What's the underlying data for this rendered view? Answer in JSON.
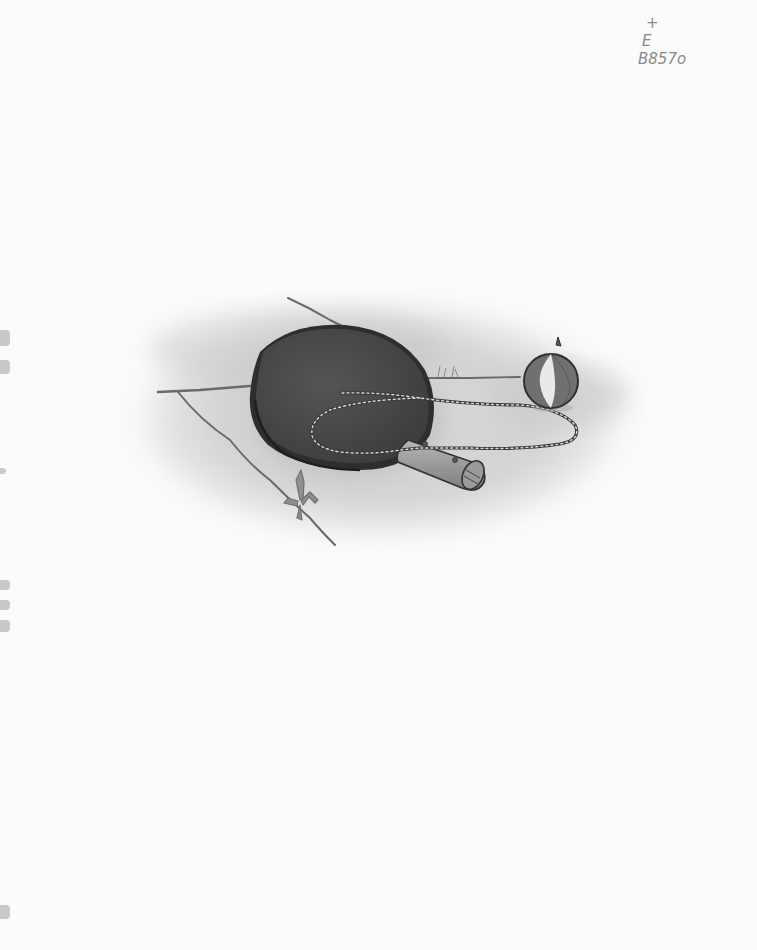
{
  "annotation": {
    "lines": [
      "+",
      "E",
      "B857o"
    ]
  },
  "illustration": {
    "subject": "table tennis paddle with chain and ball on ground",
    "objects": [
      "paddle",
      "paddle-handle",
      "chain",
      "ball",
      "grass-tuft",
      "ground-crack"
    ],
    "colors": {
      "paper": "#fbfbfb",
      "paddle_face": "#4a4a4a",
      "paddle_edge": "#2a2a2a",
      "handle": "#9a9a9a",
      "ground_shade": "#c8c8c8",
      "ball_dark": "#6e6e6e",
      "ball_light": "#e8e8e8",
      "grass": "#7a7a7a"
    }
  },
  "edge_marks": [
    {
      "top": 330,
      "height": 16
    },
    {
      "top": 360,
      "height": 14
    },
    {
      "top": 468,
      "height": 6
    },
    {
      "top": 580,
      "height": 10
    },
    {
      "top": 600,
      "height": 10
    },
    {
      "top": 620,
      "height": 12
    },
    {
      "top": 905,
      "height": 14
    }
  ]
}
